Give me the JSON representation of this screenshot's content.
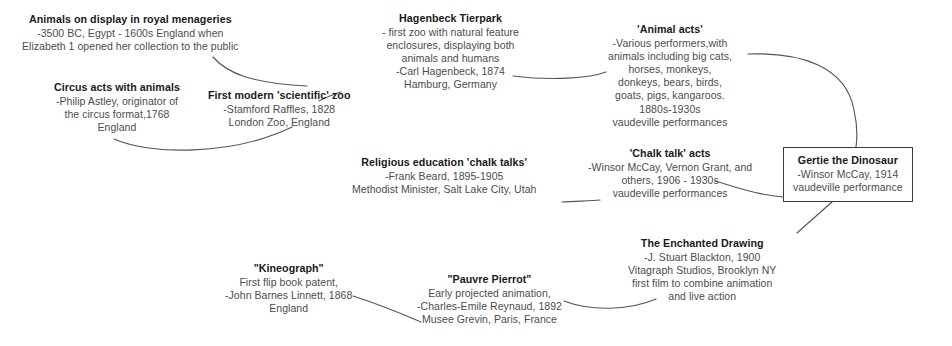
{
  "diagram": {
    "nodes": [
      {
        "id": "royal-menageries",
        "title": "Animals on display in royal menageries",
        "lines": [
          "-3500 BC, Egypt - 1600s England when",
          "Elizabeth 1 opened her collection to the public"
        ],
        "boxed": false
      },
      {
        "id": "circus-acts",
        "title": "Circus acts with animals",
        "lines": [
          "-Philip Astley, originator of",
          "the circus format,1768",
          "England"
        ],
        "boxed": false
      },
      {
        "id": "first-modern-scientific-zoo",
        "title": "First modern 'scientific' zoo",
        "lines": [
          "-Stamford Raffles, 1828",
          "London Zoo, England"
        ],
        "boxed": false
      },
      {
        "id": "hagenbeck-tierpark",
        "title": "Hagenbeck Tierpark",
        "lines": [
          "- first zoo with natural feature",
          "enclosures, displaying both",
          "animals and humans",
          "-Carl Hagenbeck, 1874",
          "Hamburg, Germany"
        ],
        "boxed": false
      },
      {
        "id": "animal-acts",
        "title": "'Animal acts'",
        "lines": [
          "-Various performers,with",
          "animals including big cats,",
          "horses, monkeys,",
          "donkeys, bears, birds,",
          "goats, pigs, kangaroos.",
          "1880s-1930s",
          "vaudeville performances"
        ],
        "boxed": false
      },
      {
        "id": "religious-education-chalk-talks",
        "title": "Religious education 'chalk talks'",
        "lines": [
          "-Frank Beard, 1895-1905",
          "Methodist Minister, Salt Lake City, Utah"
        ],
        "boxed": false
      },
      {
        "id": "chalk-talk-acts",
        "title": "'Chalk talk' acts",
        "lines": [
          "-Winsor McCay, Vernon Grant, and",
          "others, 1906 - 1930s",
          "vaudeville performances"
        ],
        "boxed": false
      },
      {
        "id": "gertie-the-dinosaur",
        "title": "Gertie the Dinosaur",
        "lines": [
          "-Winsor McCay, 1914",
          "vaudeville performance"
        ],
        "boxed": true
      },
      {
        "id": "enchanted-drawing",
        "title": "The Enchanted Drawing",
        "lines": [
          "-J. Stuart Blackton, 1900",
          "Vitagraph Studios, Brooklyn NY",
          "first film to combine animation",
          "and live action"
        ],
        "boxed": false
      },
      {
        "id": "pauvre-pierrot",
        "title": "\"Pauvre Pierrot\"",
        "lines": [
          "Early projected animation,",
          "-Charles-Emile Reynaud, 1892",
          "Musee Grevin, Paris, France"
        ],
        "boxed": false
      },
      {
        "id": "kineograph",
        "title": "\"Kineograph\"",
        "lines": [
          "First flip book patent,",
          "-John Barnes Linnett, 1868",
          "England"
        ],
        "boxed": false
      }
    ],
    "colors": {
      "title_text": "#1a1a1a",
      "body_text": "#4c4c4c",
      "connector": "#555555",
      "box_border": "#3a3a3a",
      "background": "#ffffff"
    }
  }
}
